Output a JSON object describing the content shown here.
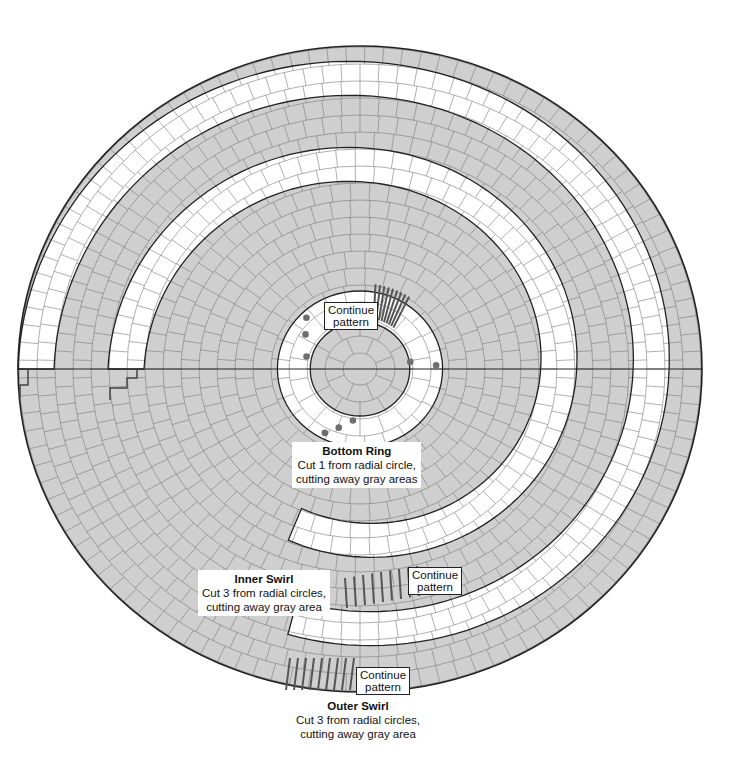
{
  "diagram": {
    "colors": {
      "gray_fill": "#cfcfcf",
      "white_fill": "#ffffff",
      "outline": "#222222",
      "grid": "#7a7a7a",
      "dots": "#6e6e6e"
    },
    "labels": {
      "center_continue": {
        "line1": "Continue",
        "line2": "pattern"
      },
      "bottom_ring": {
        "title": "Bottom Ring",
        "line1": "Cut 1 from radial circle,",
        "line2": "cutting away gray areas"
      },
      "inner_swirl": {
        "title": "Inner Swirl",
        "line1": "Cut 3 from radial circles,",
        "line2": "cutting away gray area"
      },
      "inner_continue": {
        "line1": "Continue",
        "line2": "pattern"
      },
      "outer_swirl": {
        "title": "Outer Swirl",
        "line1": "Cut 3 from radial circles,",
        "line2": "cutting away gray area"
      },
      "outer_continue": {
        "line1": "Continue",
        "line2": "pattern"
      }
    },
    "components": [
      "center rosette",
      "bottom ring",
      "inner swirl",
      "outer swirl"
    ]
  }
}
